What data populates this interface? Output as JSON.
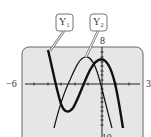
{
  "figure": {
    "type": "graphing-calculator-screen",
    "window": {
      "xmin": -6,
      "xmax": 3,
      "ymin": -10,
      "ymax": 8
    },
    "labels": {
      "xmin": "−6",
      "xmax": "3",
      "ymax": "8",
      "ymin": "−10"
    },
    "callouts": [
      {
        "id": "y1",
        "text": "Y₁",
        "style": "thick"
      },
      {
        "id": "y2",
        "text": "Y₂",
        "style": "thin"
      }
    ],
    "colors": {
      "screen": "#e6e6e6",
      "border": "#555555",
      "curve": "#111111"
    }
  }
}
